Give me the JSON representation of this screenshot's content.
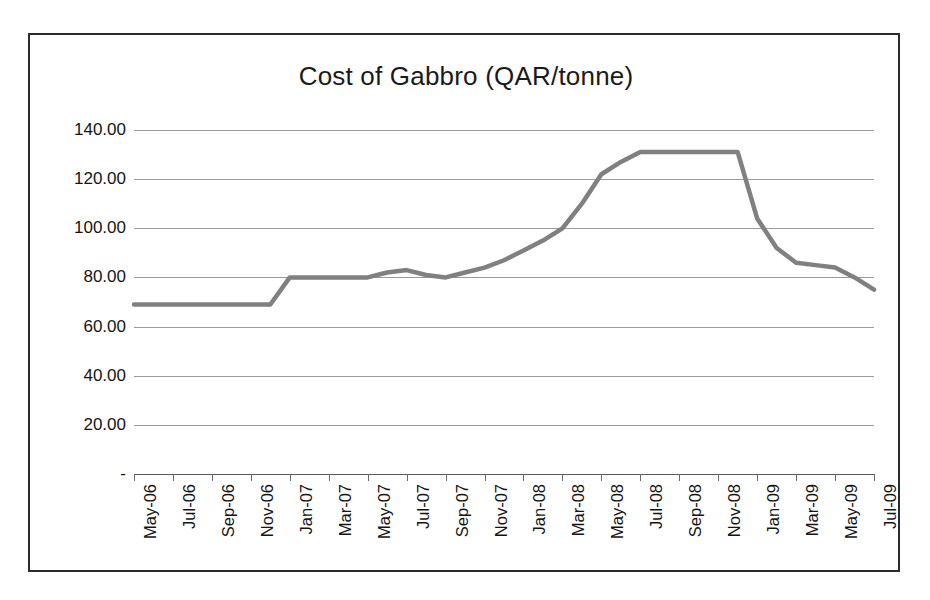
{
  "chart_data": {
    "type": "line",
    "title": "Cost of Gabbro (QAR/tonne)",
    "xlabel": "",
    "ylabel": "",
    "ylim": [
      0,
      140
    ],
    "ytick_labels": [
      "140.00",
      "120.00",
      "100.00",
      "80.00",
      "60.00",
      "40.00",
      "20.00",
      "-"
    ],
    "ytick_values": [
      140,
      120,
      100,
      80,
      60,
      40,
      20,
      0
    ],
    "grid": true,
    "legend": false,
    "line_color": "#808080",
    "x": [
      "May-06",
      "Jun-06",
      "Jul-06",
      "Aug-06",
      "Sep-06",
      "Oct-06",
      "Nov-06",
      "Dec-06",
      "Jan-07",
      "Feb-07",
      "Mar-07",
      "Apr-07",
      "May-07",
      "Jun-07",
      "Jul-07",
      "Aug-07",
      "Sep-07",
      "Oct-07",
      "Nov-07",
      "Dec-07",
      "Jan-08",
      "Feb-08",
      "Mar-08",
      "Apr-08",
      "May-08",
      "Jun-08",
      "Jul-08",
      "Aug-08",
      "Sep-08",
      "Oct-08",
      "Nov-08",
      "Dec-08",
      "Jan-09",
      "Feb-09",
      "Mar-09",
      "Apr-09",
      "May-09",
      "Jun-09",
      "Jul-09"
    ],
    "xtick_labels": [
      "May-06",
      "Jul-06",
      "Sep-06",
      "Nov-06",
      "Jan-07",
      "Mar-07",
      "May-07",
      "Jul-07",
      "Sep-07",
      "Nov-07",
      "Jan-08",
      "Mar-08",
      "May-08",
      "Jul-08",
      "Sep-08",
      "Nov-08",
      "Jan-09",
      "Mar-09",
      "May-09",
      "Jul-09"
    ],
    "values": [
      69,
      69,
      69,
      69,
      69,
      69,
      69,
      69,
      80,
      80,
      80,
      80,
      80,
      82,
      83,
      81,
      80,
      82,
      84,
      87,
      91,
      95,
      100,
      110,
      122,
      127,
      131,
      131,
      131,
      131,
      131,
      131,
      104,
      92,
      86,
      85,
      84,
      80,
      75
    ],
    "series_name": "Cost of Gabbro"
  }
}
